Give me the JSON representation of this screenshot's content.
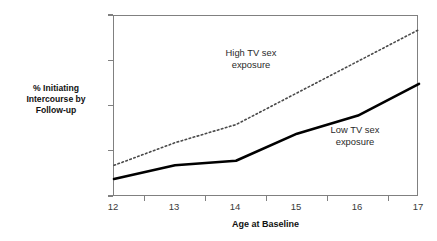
{
  "chart_data": {
    "type": "line",
    "title": "",
    "xlabel": "Age at Baseline",
    "ylabel": "% Initiating Intercourse by Follow-up",
    "categories": [
      "12",
      "13",
      "14",
      "15",
      "16",
      "17"
    ],
    "x": [
      12,
      13,
      14,
      15,
      16,
      17
    ],
    "xlim": [
      12,
      17
    ],
    "ylim": [
      0,
      40
    ],
    "ytick_labels": [
      "0%",
      "10%",
      "20%",
      "30%",
      "40%"
    ],
    "ytick_values": [
      0,
      10,
      20,
      30,
      40
    ],
    "xtick_labels": [
      "12",
      "13",
      "14",
      "15",
      "16",
      "17"
    ],
    "grid": false,
    "legend_position": "inline-annotations",
    "series": [
      {
        "name": "High TV sex exposure",
        "style": "dotted",
        "color": "#4a4a4a",
        "values": [
          7,
          12,
          16,
          23,
          30,
          37
        ]
      },
      {
        "name": "Low TV sex exposure",
        "style": "solid",
        "color": "#000000",
        "values": [
          4,
          7,
          8,
          14,
          18,
          25
        ]
      }
    ],
    "annotations": [
      {
        "id": "high",
        "line1": "High TV sex",
        "line2": "exposure"
      },
      {
        "id": "low",
        "line1": "Low TV sex",
        "line2": "exposure"
      }
    ]
  },
  "axis": {
    "y_title_line1": "% Initiating",
    "y_title_line2": "Intercourse by",
    "y_title_line3": "Follow-up",
    "x_title": "Age at Baseline"
  },
  "colors": {
    "frame": "#808080",
    "high_series": "#4a4a4a",
    "low_series": "#000000",
    "text": "#1a1a1a"
  }
}
